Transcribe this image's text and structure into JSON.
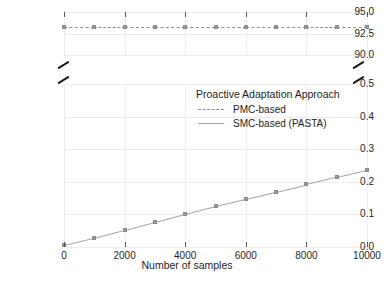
{
  "chart_data": {
    "type": "line",
    "title": "",
    "xlabel": "Number of samples",
    "ylabel": "Adaptation planning time (s)",
    "broken_axis": true,
    "grid": true,
    "legend_position": "inside-upper-right",
    "legend_title": "Proactive Adaptation Approach",
    "x": [
      0,
      1000,
      2000,
      3000,
      4000,
      5000,
      6000,
      7000,
      8000,
      9000,
      10000
    ],
    "xlim": [
      0,
      10000
    ],
    "xticks": [
      "0",
      "2000",
      "4000",
      "6000",
      "8000",
      "10000"
    ],
    "xtick_values": [
      0,
      2000,
      4000,
      6000,
      8000,
      10000
    ],
    "panels": [
      {
        "name": "upper",
        "ylim": [
          90.0,
          95.0
        ],
        "yticks": [
          "95.0",
          "92.5",
          "90.0"
        ],
        "ytick_values": [
          95.0,
          92.5,
          90.0
        ]
      },
      {
        "name": "lower",
        "ylim": [
          0.0,
          0.5
        ],
        "yticks": [
          "0.5",
          "0.4",
          "0.3",
          "0.2",
          "0.1",
          "0.0"
        ],
        "ytick_values": [
          0.5,
          0.4,
          0.3,
          0.2,
          0.1,
          0.0
        ]
      }
    ],
    "series": [
      {
        "name": "PMC-based",
        "style": "dashed",
        "panel": "upper",
        "color": "#8f8f8f",
        "values": [
          93.2,
          93.2,
          93.2,
          93.2,
          93.2,
          93.2,
          93.2,
          93.2,
          93.2,
          93.2,
          93.2
        ]
      },
      {
        "name": "SMC-based (PASTA)",
        "style": "solid",
        "panel": "lower",
        "color": "#a6a6a6",
        "values": [
          0.005,
          0.027,
          0.052,
          0.077,
          0.102,
          0.126,
          0.148,
          0.17,
          0.192,
          0.214,
          0.236
        ]
      }
    ]
  },
  "legend": {
    "title": "Proactive Adaptation Approach",
    "items": [
      {
        "label": "PMC-based",
        "style": "dashed"
      },
      {
        "label": "SMC-based (PASTA)",
        "style": "solid"
      }
    ]
  },
  "axes": {
    "y_title": "Adaptation planning time (s)",
    "x_title": "Number of samples"
  },
  "caption": "",
  "colors": {
    "pmc_line": "#8f8f8f",
    "smc_line": "#a6a6a6",
    "point": "#9a9a9a",
    "grid": "#ededed",
    "text": "#1e1e1e",
    "break_mark": "#1b1b1b"
  }
}
